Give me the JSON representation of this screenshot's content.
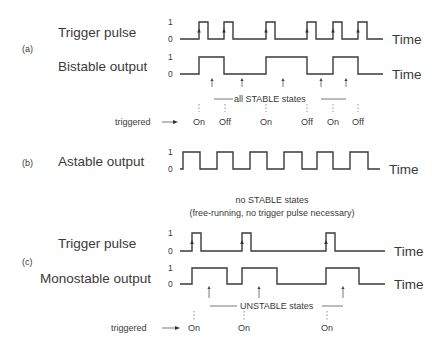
{
  "colors": {
    "line": "#3a3a3a",
    "text": "#3a3a3a",
    "background": "#ffffff"
  },
  "axis_label": "Time",
  "level_labels": {
    "high": "1",
    "low": "0"
  },
  "sections": [
    {
      "id": "a",
      "tag": "(a)",
      "signals": [
        {
          "name": "Trigger pulse",
          "x_start": 180,
          "x_end": 383,
          "y_high": 22,
          "y_low": 39,
          "edges": [
            199,
            208,
            224,
            233,
            266,
            275,
            307,
            316,
            333,
            342,
            358,
            367
          ],
          "start_level": 0,
          "rise_arrows": [
            199,
            224,
            266,
            307,
            333,
            358
          ]
        },
        {
          "name": "Bistable output",
          "x_start": 180,
          "x_end": 383,
          "y_high": 57,
          "y_low": 74,
          "edges": [
            199,
            224,
            266,
            307,
            333,
            358
          ],
          "start_level": 0,
          "rise_arrows": []
        }
      ],
      "state_arrows": {
        "xs": [
          212,
          242,
          283,
          321,
          346
        ],
        "y_top": 78,
        "y_bottom": 87
      },
      "state_caption": {
        "text": "all STABLE states",
        "x": 234,
        "y": 102,
        "line_left": [
          214,
          233
        ],
        "line_right": [
          321,
          346
        ],
        "line_y": 99
      },
      "triggered": {
        "label": "triggered",
        "label_x": 115,
        "label_y": 125,
        "arrow_x1": 162,
        "arrow_x2": 178,
        "arrow_y": 122,
        "marks": [
          {
            "x": 199,
            "text": "On"
          },
          {
            "x": 225,
            "text": "Off"
          },
          {
            "x": 266,
            "text": "On"
          },
          {
            "x": 307,
            "text": "Off"
          },
          {
            "x": 333,
            "text": "On"
          },
          {
            "x": 358,
            "text": "Off"
          }
        ],
        "mark_y": 125,
        "dash_y1": 104,
        "dash_y2": 112
      }
    },
    {
      "id": "b",
      "tag": "(b)",
      "signals": [
        {
          "name": "Astable output",
          "x_start": 180,
          "x_end": 380,
          "y_high": 152,
          "y_low": 169,
          "edges": [
            183,
            200,
            217,
            233,
            250,
            267,
            284,
            302,
            317,
            333,
            350,
            368
          ],
          "start_level": 0,
          "rise_arrows": []
        }
      ],
      "caption_lines": [
        "no STABLE states",
        "(free-running, no trigger pulse necessary)"
      ]
    },
    {
      "id": "c",
      "tag": "(c)",
      "signals": [
        {
          "name": "Trigger pulse",
          "x_start": 180,
          "x_end": 385,
          "y_high": 233,
          "y_low": 251,
          "edges": [
            192,
            201,
            242,
            251,
            326,
            335
          ],
          "start_level": 0,
          "rise_arrows": [
            192,
            242,
            326
          ]
        },
        {
          "name": "Monostable output",
          "x_start": 180,
          "x_end": 385,
          "y_high": 268,
          "y_low": 284,
          "edges": [
            192,
            227,
            242,
            277,
            326,
            359
          ],
          "start_level": 0,
          "rise_arrows": []
        }
      ],
      "state_arrows": {
        "xs": [
          209,
          259,
          343
        ],
        "y_top": 286,
        "y_bottom": 298
      },
      "state_caption": {
        "text": "UNSTABLE states",
        "x": 240,
        "y": 309,
        "line_left": [
          210,
          237
        ],
        "line_right": [
          322,
          343
        ],
        "line_y": 306
      },
      "triggered": {
        "label": "triggered",
        "label_x": 111,
        "label_y": 331,
        "arrow_x1": 162,
        "arrow_x2": 180,
        "arrow_y": 328,
        "marks": [
          {
            "x": 194,
            "text": "On"
          },
          {
            "x": 244,
            "text": "On"
          },
          {
            "x": 327,
            "text": "On"
          }
        ],
        "mark_y": 331,
        "dash_y1": 311,
        "dash_y2": 320
      }
    }
  ],
  "chart_data": {
    "type": "timing-diagram",
    "title": "",
    "xlabel": "Time",
    "panels": [
      {
        "tag": "(a)",
        "series": [
          {
            "name": "Trigger pulse",
            "values": [
              0,
              1,
              0,
              1,
              0,
              1,
              0,
              1,
              0,
              1,
              0,
              1,
              0
            ]
          },
          {
            "name": "Bistable output",
            "values": [
              0,
              1,
              0,
              1,
              0,
              1,
              0
            ]
          }
        ],
        "annotation": "all STABLE states",
        "triggered": [
          "On",
          "Off",
          "On",
          "Off",
          "On",
          "Off"
        ]
      },
      {
        "tag": "(b)",
        "series": [
          {
            "name": "Astable output",
            "values": [
              0,
              1,
              0,
              1,
              0,
              1,
              0,
              1,
              0,
              1,
              0,
              1,
              0
            ]
          }
        ],
        "annotation": "no STABLE states (free-running, no trigger pulse necessary)"
      },
      {
        "tag": "(c)",
        "series": [
          {
            "name": "Trigger pulse",
            "values": [
              0,
              1,
              0,
              1,
              0,
              1,
              0
            ]
          },
          {
            "name": "Monostable output",
            "values": [
              0,
              1,
              0,
              1,
              0,
              1,
              0
            ]
          }
        ],
        "annotation": "UNSTABLE states",
        "triggered": [
          "On",
          "On",
          "On"
        ]
      }
    ]
  }
}
